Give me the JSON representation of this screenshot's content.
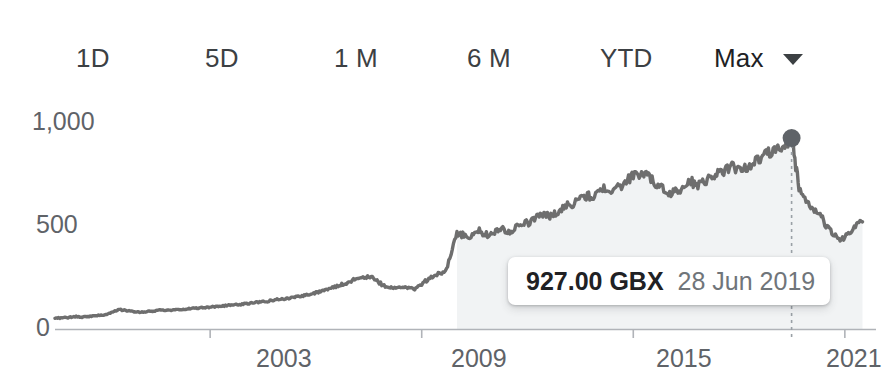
{
  "range_selector": {
    "items": [
      {
        "label": "1D",
        "name": "range-tab-1d",
        "selected": false,
        "x": 76
      },
      {
        "label": "5D",
        "name": "range-tab-5d",
        "selected": false,
        "x": 205
      },
      {
        "label": "1 M",
        "name": "range-tab-1m",
        "selected": false,
        "x": 334
      },
      {
        "label": "6 M",
        "name": "range-tab-6m",
        "selected": false,
        "x": 467
      },
      {
        "label": "YTD",
        "name": "range-tab-ytd",
        "selected": false,
        "x": 600
      },
      {
        "label": "Max",
        "name": "range-tab-max",
        "selected": true,
        "x": 714
      }
    ],
    "dropdown_icon": "chevron-down-icon"
  },
  "tooltip": {
    "price": "927.00 GBX",
    "date": "28 Jun 2019"
  },
  "colors": {
    "line": "#6e6e6e",
    "area_fill": "#f1f3f4",
    "axis": "#9aa0a6",
    "tick_text": "#5f6368",
    "tab_text": "#3c4043",
    "tooltip_price_text": "#202124",
    "tooltip_date_text": "#70757a",
    "crosshair": "#9aa0a6",
    "marker": "#5f6368",
    "background": "#ffffff"
  },
  "chart_data": {
    "type": "area",
    "title": "",
    "xlabel": "",
    "ylabel": "",
    "unit": "GBX",
    "grid": false,
    "legend": false,
    "xlim": [
      1998.6,
      2021.6
    ],
    "ylim": [
      0,
      1150
    ],
    "y_ticks": [
      0,
      500,
      1000
    ],
    "y_tick_labels": [
      "0",
      "500",
      "1,000"
    ],
    "x_ticks": [
      2003,
      2009,
      2015,
      2021
    ],
    "x_tick_labels": [
      "2003",
      "2009",
      "2015",
      "2021"
    ],
    "highlight": {
      "x": 2019.49,
      "y": 927.0,
      "label": "28 Jun 2019",
      "value_label": "927.00 GBX"
    },
    "series": [
      {
        "name": "Price",
        "x": [
          1998.6,
          1998.9,
          1999.2,
          1999.5,
          1999.8,
          2000.1,
          2000.4,
          2000.7,
          2001.0,
          2001.3,
          2001.6,
          2001.9,
          2002.2,
          2002.5,
          2002.8,
          2003.1,
          2003.4,
          2003.7,
          2004.0,
          2004.3,
          2004.6,
          2004.9,
          2005.2,
          2005.5,
          2005.8,
          2006.1,
          2006.4,
          2006.7,
          2007.0,
          2007.3,
          2007.6,
          2007.9,
          2008.2,
          2008.5,
          2008.8,
          2009.1,
          2009.4,
          2009.7,
          2010.0,
          2010.3,
          2010.6,
          2010.9,
          2011.2,
          2011.5,
          2011.8,
          2012.1,
          2012.4,
          2012.7,
          2013.0,
          2013.3,
          2013.6,
          2013.9,
          2014.2,
          2014.5,
          2014.8,
          2015.1,
          2015.4,
          2015.7,
          2016.0,
          2016.3,
          2016.6,
          2016.9,
          2017.2,
          2017.5,
          2017.8,
          2018.1,
          2018.4,
          2018.7,
          2019.0,
          2019.3,
          2019.49,
          2019.7,
          2020.0,
          2020.3,
          2020.6,
          2020.9,
          2021.2,
          2021.5
        ],
        "y": [
          52,
          55,
          60,
          58,
          66,
          72,
          95,
          88,
          80,
          86,
          92,
          90,
          96,
          100,
          104,
          108,
          112,
          118,
          122,
          130,
          134,
          142,
          150,
          158,
          168,
          182,
          196,
          214,
          232,
          256,
          248,
          212,
          196,
          208,
          190,
          232,
          262,
          286,
          470,
          444,
          478,
          452,
          490,
          470,
          508,
          520,
          560,
          548,
          590,
          610,
          648,
          640,
          690,
          672,
          718,
          760,
          742,
          700,
          650,
          678,
          716,
          700,
          744,
          760,
          790,
          770,
          806,
          840,
          866,
          900,
          927,
          690,
          596,
          548,
          470,
          430,
          486,
          520
        ]
      }
    ]
  }
}
